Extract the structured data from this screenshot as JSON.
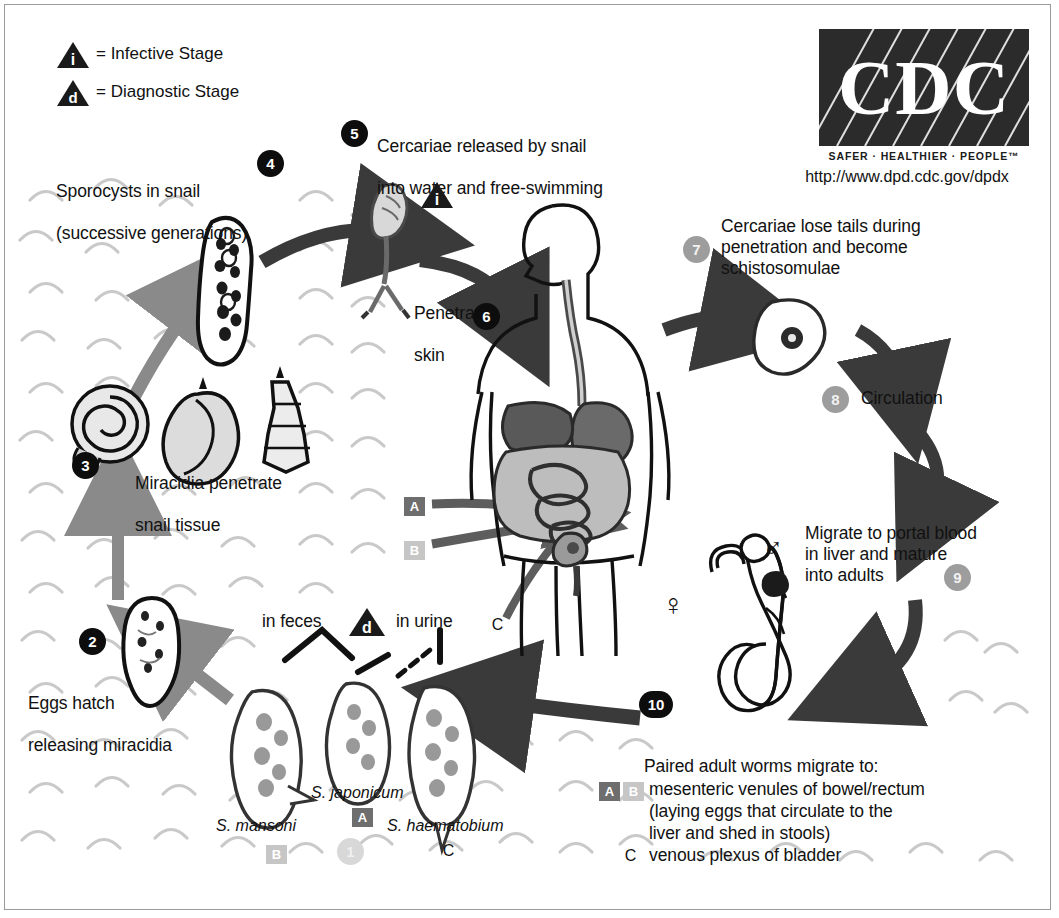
{
  "diagram": {
    "organization": "CDC",
    "tagline": "SAFER · HEALTHIER · PEOPLE™",
    "url": "http://www.dpd.cdc.gov/dpdx"
  },
  "legend": {
    "infective": {
      "marker": "i",
      "label": "= Infective Stage"
    },
    "diagnostic": {
      "marker": "d",
      "label": "= Diagnostic Stage"
    }
  },
  "steps": [
    {
      "number": "1",
      "style": "faint",
      "text": ""
    },
    {
      "number": "2",
      "style": "black",
      "text": "Eggs hatch\nreleasing miracidia"
    },
    {
      "number": "3",
      "style": "black",
      "text": "Miracidia penetrate\nsnail tissue"
    },
    {
      "number": "4",
      "style": "black",
      "text": "Sporocysts in snail\n(successive generations)"
    },
    {
      "number": "5",
      "style": "black",
      "text": "Cercariae released by snail\ninto water and free-swimming"
    },
    {
      "number": "6",
      "style": "black",
      "text": "Penetrate\nskin"
    },
    {
      "number": "7",
      "style": "gray",
      "text": "Cercariae lose tails during\npenetration and become\nschistosomulae"
    },
    {
      "number": "8",
      "style": "gray",
      "text": "Circulation"
    },
    {
      "number": "9",
      "style": "gray",
      "text": "Migrate to portal blood\nin liver and mature\ninto adults"
    },
    {
      "number": "10",
      "style": "black",
      "text": "Paired adult worms migrate to:"
    }
  ],
  "step_labels": {
    "sporocysts_line1": "Sporocysts in snail",
    "sporocysts_line2": "(successive generations)",
    "cercariae_line1": "Cercariae released by snail",
    "cercariae_line2": "into water and free-swimming",
    "penetrate_line1": "Penetrate",
    "penetrate_line2": "skin",
    "miracidia_line1": "Miracidia penetrate",
    "miracidia_line2": "snail tissue",
    "eggs_line1": "Eggs hatch",
    "eggs_line2": "releasing miracidia",
    "lose_tails": "Cercariae lose tails during\npenetration and become\nschistosomulae",
    "circulation": "Circulation",
    "migrate_portal": "Migrate to portal blood\nin liver and mature\ninto adults"
  },
  "adult_worms": {
    "heading": "Paired adult worms migrate to:",
    "site_ab": "mesenteric venules of bowel/rectum",
    "site_ab_detail1": "(laying eggs that circulate to the",
    "site_ab_detail2": "liver and shed in stools)",
    "site_c": "venous plexus of bladder",
    "badge_a": "A",
    "badge_b": "B",
    "badge_c": "C",
    "female_symbol": "♀",
    "male_symbol": "♂"
  },
  "eggs": {
    "in_feces": "in feces",
    "in_urine": "in urine",
    "diagnostic_marker": "d",
    "species": [
      {
        "name": "S. mansoni",
        "badge": "B",
        "badge_style": "light"
      },
      {
        "name": "S. japonicum",
        "badge": "A",
        "badge_style": "dark"
      },
      {
        "name": "S. haematobium",
        "badge": "C",
        "badge_style": "plain"
      }
    ]
  },
  "host_badges": {
    "a": "A",
    "b": "B",
    "c": "C"
  },
  "colors": {
    "black": "#0d0d0d",
    "gray_circle": "#9d9d9d",
    "badge_dark": "#6e6e6e",
    "badge_light": "#c6c6c6",
    "water": "#c9c9c9",
    "arrow_dark": "#3a3a3a",
    "arrow_gray": "#8a8a8a",
    "logo_bg": "#2b2b2b"
  }
}
